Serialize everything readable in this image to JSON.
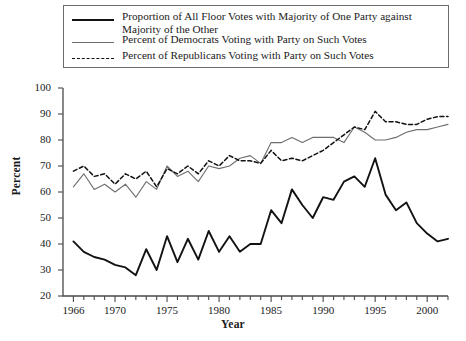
{
  "figure": {
    "background": "#ffffff"
  },
  "legend": {
    "position": "top-center",
    "border_color": "#6b6b6b",
    "entries": [
      {
        "style": "thick-solid",
        "color": "#121212",
        "label": "Proportion of All Floor Votes with Majority of One Party against Majority of the Other"
      },
      {
        "style": "thin-solid",
        "color": "#6e6e6e",
        "label": "Percent of Democrats Voting with Party on Such Votes"
      },
      {
        "style": "dashed",
        "color": "#121212",
        "label": "Percent of Republicans Voting with Party on Such Votes"
      }
    ]
  },
  "chart_data": {
    "type": "line",
    "title": "",
    "xlabel": "Year",
    "ylabel": "Percent",
    "xlim": [
      1965,
      2002
    ],
    "ylim": [
      20,
      100
    ],
    "ytick_values": [
      20,
      30,
      40,
      50,
      60,
      70,
      80,
      90,
      100
    ],
    "ytick_labels": [
      "20",
      "30",
      "40",
      "50",
      "60",
      "70",
      "80",
      "90",
      "100"
    ],
    "xtick_values": [
      1966,
      1970,
      1975,
      1980,
      1985,
      1990,
      1995,
      2000
    ],
    "xtick_labels": [
      "1966",
      "1970",
      "1975",
      "1980",
      "1985",
      "1990",
      "1995",
      "2000"
    ],
    "minor_xticks_every": 1,
    "grid": false,
    "legend_position": "above-axes",
    "x": [
      1966,
      1967,
      1968,
      1969,
      1970,
      1971,
      1972,
      1973,
      1974,
      1975,
      1976,
      1977,
      1978,
      1979,
      1980,
      1981,
      1982,
      1983,
      1984,
      1985,
      1986,
      1987,
      1988,
      1989,
      1990,
      1991,
      1992,
      1993,
      1994,
      1995,
      1996,
      1997,
      1998,
      1999,
      2000,
      2001,
      2002
    ],
    "series": [
      {
        "name": "Proportion of All Floor Votes with Majority of One Party against Majority of the Other",
        "style": "thick-solid",
        "color": "#121212",
        "values": [
          41,
          37,
          35,
          34,
          32,
          31,
          28,
          38,
          30,
          43,
          33,
          42,
          34,
          45,
          37,
          43,
          37,
          40,
          40,
          53,
          48,
          61,
          55,
          50,
          58,
          57,
          64,
          66,
          62,
          73,
          59,
          53,
          56,
          48,
          44,
          41,
          42
        ]
      },
      {
        "name": "Percent of Democrats Voting with Party on Such Votes",
        "style": "thin-solid",
        "color": "#6e6e6e",
        "values": [
          62,
          67,
          61,
          63,
          60,
          63,
          58,
          64,
          61,
          70,
          66,
          68,
          64,
          70,
          69,
          70,
          73,
          74,
          71,
          79,
          79,
          81,
          79,
          81,
          81,
          81,
          79,
          85,
          83,
          80,
          80,
          81,
          83,
          84,
          84,
          85,
          86
        ]
      },
      {
        "name": "Percent of Republicans Voting with Party on Such Votes",
        "style": "dashed",
        "color": "#121212",
        "values": [
          68,
          70,
          66,
          67,
          63,
          67,
          65,
          68,
          62,
          69,
          67,
          70,
          67,
          72,
          70,
          74,
          72,
          72,
          71,
          76,
          72,
          73,
          72,
          74,
          76,
          79,
          82,
          85,
          84,
          91,
          87,
          87,
          86,
          86,
          88,
          89,
          89
        ]
      }
    ]
  }
}
